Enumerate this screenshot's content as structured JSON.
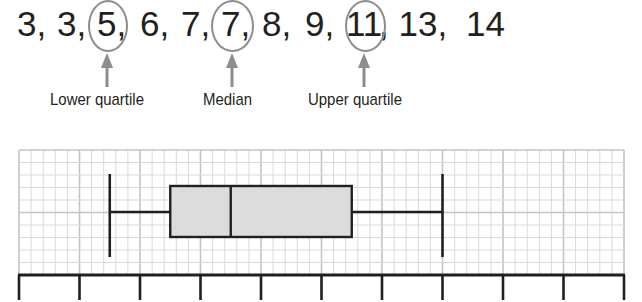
{
  "sequence": {
    "items": [
      {
        "text": "3,",
        "x": 17
      },
      {
        "text": "3,",
        "x": 57
      },
      {
        "text": "5,",
        "x": 97
      },
      {
        "text": "6,",
        "x": 140
      },
      {
        "text": "7,",
        "x": 181
      },
      {
        "text": "7,",
        "x": 221
      },
      {
        "text": "8,",
        "x": 262
      },
      {
        "text": "9,",
        "x": 305
      },
      {
        "text": "11",
        "x": 346
      },
      {
        "text": ", 13,",
        "x": 379
      },
      {
        "text": "14",
        "x": 466
      }
    ],
    "circles": [
      {
        "name": "lower-quartile-circle",
        "x": 88,
        "w": 40
      },
      {
        "name": "median-circle",
        "x": 211,
        "w": 43
      },
      {
        "name": "upper-quartile-circle",
        "x": 345,
        "w": 41
      }
    ]
  },
  "annotations": [
    {
      "label": "Lower quartile",
      "arrow_x": 107,
      "label_x": 50
    },
    {
      "label": "Median",
      "arrow_x": 232,
      "label_x": 203
    },
    {
      "label": "Upper quartile",
      "arrow_x": 364,
      "label_x": 308
    }
  ],
  "colors": {
    "ink": "#231f20",
    "annotation_gray": "#8d8d8d",
    "box_fill": "#dcdcdc",
    "grid_minor": "#d9d9d9",
    "grid_major": "#c4c4c4"
  },
  "chart_data": {
    "type": "boxplot",
    "title": "",
    "data": [
      3,
      3,
      5,
      6,
      7,
      7,
      8,
      9,
      11,
      13,
      14
    ],
    "min": 3,
    "lower_quartile": 5,
    "median": 7,
    "upper_quartile": 11,
    "max": 14,
    "xlim": [
      0,
      20
    ],
    "tick_step": 2,
    "tick_labels": [],
    "grid": true,
    "xlabel": "",
    "ylabel": ""
  }
}
